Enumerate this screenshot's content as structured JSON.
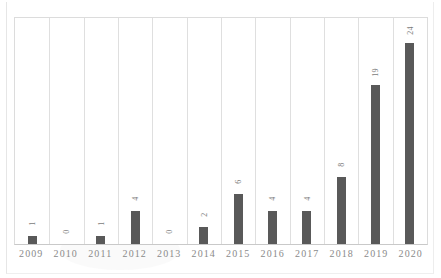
{
  "chart_data": {
    "type": "bar",
    "title": "",
    "subtitle": "",
    "xlabel": "",
    "ylabel": "",
    "categories": [
      "2009",
      "2010",
      "2011",
      "2012",
      "2013",
      "2014",
      "2015",
      "2016",
      "2017",
      "2018",
      "2019",
      "2020"
    ],
    "values": [
      1,
      0,
      1,
      4,
      0,
      2,
      6,
      4,
      4,
      8,
      19,
      24
    ],
    "data_labels": [
      "1",
      "0",
      "1",
      "4",
      "0",
      "2",
      "6",
      "4",
      "4",
      "8",
      "19",
      "24"
    ],
    "data_labels_rotation": "-90",
    "ylim": [
      0,
      27
    ],
    "grid": {
      "vertical": true,
      "horizontal": false,
      "color": "#dfdfdf"
    },
    "legend": {
      "show": false,
      "position": "none",
      "entries": []
    },
    "series": [
      {
        "name": "",
        "color": "#595959",
        "values": [
          1,
          0,
          1,
          4,
          0,
          2,
          6,
          4,
          4,
          8,
          19,
          24
        ]
      }
    ],
    "axis_line_color": "#c9c9c9",
    "plot_border_color": "#dcdcdc",
    "tick_label_color": "#8a8a8a",
    "data_label_color": "#7b7b7b",
    "background": "#ffffff"
  }
}
